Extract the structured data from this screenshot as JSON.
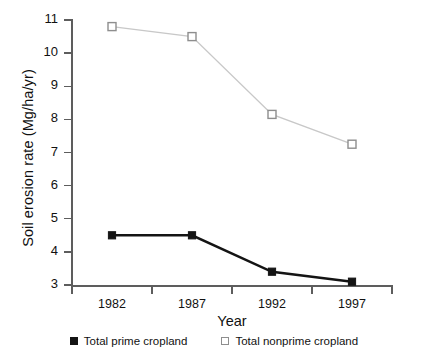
{
  "chart_data": {
    "type": "line",
    "title": "",
    "xlabel": "Year",
    "ylabel": "Soil erosion rate (Mg/ha/yr)",
    "categories": [
      "1982",
      "1987",
      "1992",
      "1997"
    ],
    "xtick_labels": [
      "1982",
      "1987",
      "1992",
      "1997"
    ],
    "ytick_labels": [
      "3",
      "4",
      "5",
      "6",
      "7",
      "8",
      "9",
      "10",
      "11"
    ],
    "ylim": [
      3,
      11
    ],
    "grid": false,
    "legend_position": "bottom-center",
    "series": [
      {
        "name": "Total prime cropland",
        "marker": "filled-square",
        "color": "#141414",
        "values": [
          4.5,
          4.5,
          3.4,
          3.1
        ]
      },
      {
        "name": "Total nonprime cropland",
        "marker": "open-square",
        "color": "#c8c8c8",
        "marker_edge_color": "#8e8e8e",
        "values": [
          10.8,
          10.5,
          8.15,
          7.25
        ]
      }
    ]
  },
  "legend": {
    "items": [
      {
        "label": "Total prime cropland",
        "swatch": "filled-square-icon"
      },
      {
        "label": "Total nonprime cropland",
        "swatch": "open-square-icon"
      }
    ]
  },
  "axes": {
    "y_title": "Soil erosion rate (Mg/ha/yr)",
    "x_title": "Year"
  }
}
